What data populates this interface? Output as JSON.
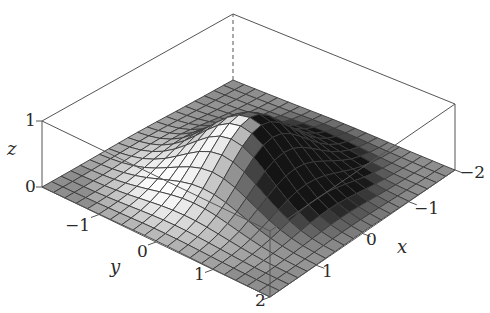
{
  "chart_data": {
    "type": "surface",
    "title": "",
    "function": "z = exp(-(x^2 + y^2))",
    "xlabel": "x",
    "ylabel": "y",
    "zlabel": "z",
    "xlim": [
      -2,
      2
    ],
    "ylim": [
      -2,
      2
    ],
    "zlim": [
      0,
      1
    ],
    "grid_n": 20,
    "x_ticks": [
      "-2",
      "-1",
      "0",
      "1",
      "2"
    ],
    "y_ticks": [
      "-2",
      "-1",
      "0",
      "1",
      "2"
    ],
    "z_ticks": [
      "0",
      "1"
    ],
    "shading": "grayscale-lit",
    "box": true,
    "peak": {
      "x": 0,
      "y": 0,
      "z": 1
    }
  },
  "labels": {
    "z_axis": "z",
    "y_axis": "y",
    "x_axis": "x",
    "z_tick_0": "0",
    "z_tick_1": "1",
    "y_tick_m1": "−1",
    "y_tick_0": "0",
    "y_tick_1": "1",
    "y_tick_2": "2",
    "x_tick_m2": "−2",
    "x_tick_m1": "−1",
    "x_tick_0": "0",
    "x_tick_1": "1"
  },
  "colors": {
    "mesh_line": "#3a3a3a",
    "box_line": "#555555",
    "flat_face": "#8e8e8e",
    "background": "#ffffff"
  }
}
